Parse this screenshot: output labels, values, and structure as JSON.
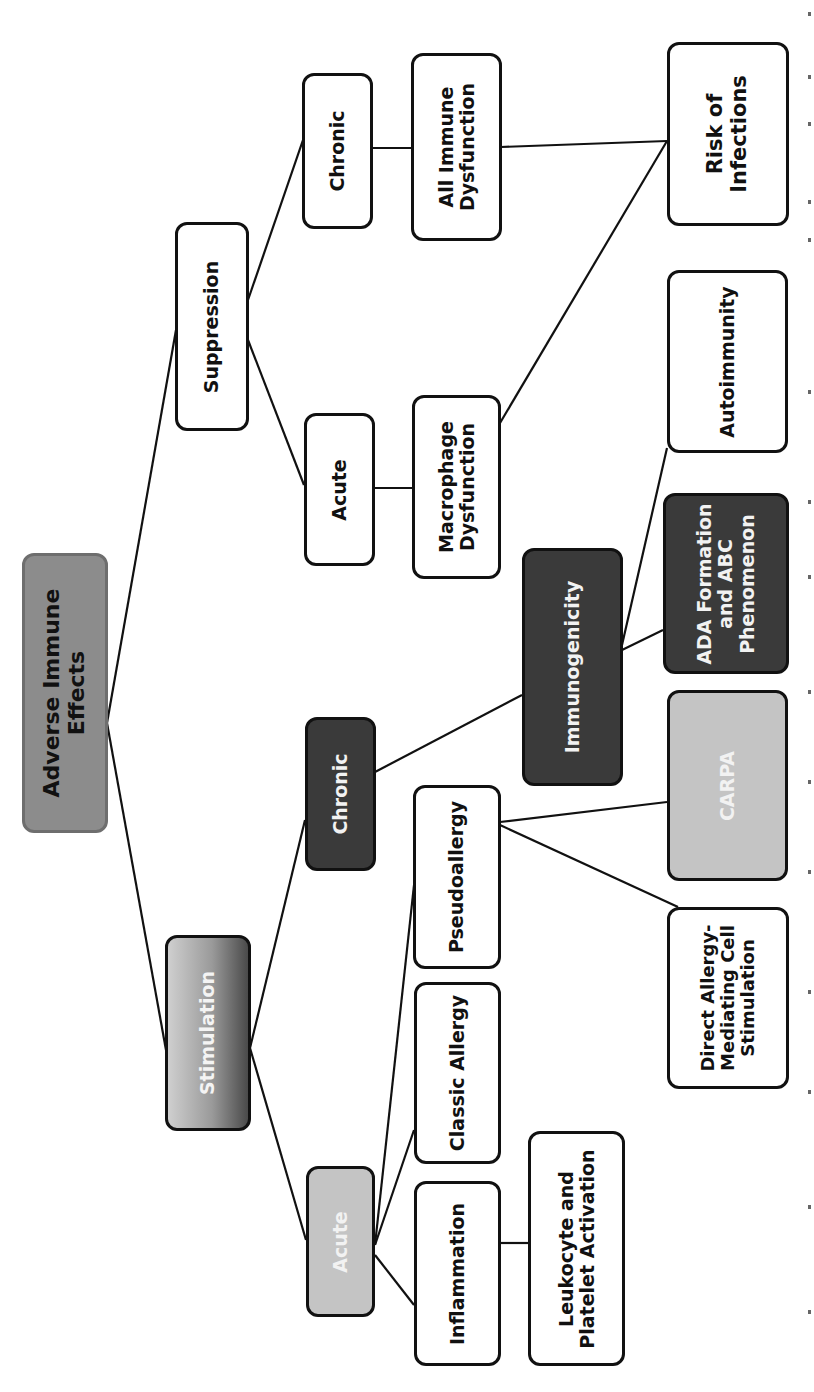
{
  "diagram": {
    "title": "Adverse Immune Effects",
    "orientation": "rotated-90-ccw",
    "colors": {
      "line": "#111111",
      "root_fill": "#8c8c8c",
      "stimulation_fill_gradient": [
        "#cfcfcf",
        "#4a4a4a"
      ],
      "light_fill": "#c4c4c4",
      "dark_fill": "#3a3a3a",
      "plain_fill": "#ffffff"
    },
    "nodes": {
      "root": "Adverse Immune\nEffects",
      "suppression": "Suppression",
      "stimulation": "Stimulation",
      "supp_acute": "Acute",
      "supp_chronic": "Chronic",
      "macrophage": "Macrophage\nDysfunction",
      "all_immune": "All Immune\nDysfunction",
      "risk_infections": "Risk of\nInfections",
      "stim_acute": "Acute",
      "stim_chronic": "Chronic",
      "inflammation": "Inflammation",
      "classic_allergy": "Classic Allergy",
      "pseudoallergy": "Pseudoallergy",
      "leukocyte": "Leukocyte and\nPlatelet Activation",
      "direct_allergy": "Direct Allergy-\nMediating Cell\nStimulation",
      "carpa": "CARPA",
      "immunogenicity": "Immunogenicity",
      "ada": "ADA Formation\nand ABC\nPhenomenon",
      "autoimmunity": "Autoimmunity"
    },
    "edges": [
      [
        "root",
        "suppression"
      ],
      [
        "root",
        "stimulation"
      ],
      [
        "suppression",
        "supp_chronic"
      ],
      [
        "suppression",
        "supp_acute"
      ],
      [
        "supp_chronic",
        "all_immune"
      ],
      [
        "supp_acute",
        "macrophage"
      ],
      [
        "all_immune",
        "risk_infections"
      ],
      [
        "macrophage",
        "risk_infections"
      ],
      [
        "stimulation",
        "stim_chronic"
      ],
      [
        "stimulation",
        "stim_acute"
      ],
      [
        "stim_chronic",
        "immunogenicity"
      ],
      [
        "immunogenicity",
        "autoimmunity"
      ],
      [
        "immunogenicity",
        "ada"
      ],
      [
        "stim_acute",
        "pseudoallergy"
      ],
      [
        "stim_acute",
        "classic_allergy"
      ],
      [
        "stim_acute",
        "inflammation"
      ],
      [
        "inflammation",
        "leukocyte"
      ],
      [
        "pseudoallergy",
        "carpa"
      ],
      [
        "pseudoallergy",
        "direct_allergy"
      ]
    ]
  }
}
